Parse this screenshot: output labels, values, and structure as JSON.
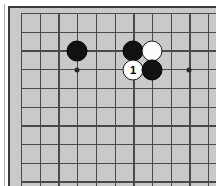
{
  "board": {
    "name": "go-board-diagram",
    "background_color": "#c9c9c9",
    "page_background": "#ffffff",
    "line_color": "#4a4a4a",
    "frame_color": "#3a3a3a",
    "grid_columns": 11,
    "grid_rows": 10,
    "grid_origin_x": 21,
    "grid_origin_y": 13,
    "grid_spacing": 18.7,
    "star_point_color": "#2c2c2c",
    "star_points": [
      {
        "name": "star-point-left",
        "x": 77,
        "y": 70
      },
      {
        "name": "star-point-right",
        "x": 189,
        "y": 70
      }
    ],
    "stones": [
      {
        "name": "black-stone-left",
        "color": "black",
        "x": 77,
        "y": 51,
        "label": ""
      },
      {
        "name": "black-stone-upper",
        "color": "black",
        "x": 133,
        "y": 51,
        "label": ""
      },
      {
        "name": "white-stone-upper-right",
        "color": "white",
        "x": 152,
        "y": 51,
        "label": ""
      },
      {
        "name": "white-stone-move-1",
        "color": "white",
        "x": 133,
        "y": 70,
        "label": "1"
      },
      {
        "name": "black-stone-lower-right",
        "color": "black",
        "x": 152,
        "y": 70,
        "label": ""
      }
    ],
    "stone_colors": {
      "black_fill": "#121212",
      "white_fill": "#fbfbfb",
      "white_outline": "#1a1a1a",
      "black_label_text": "#ffffff",
      "white_label_text": "#000000"
    },
    "move_numbers": [
      "1"
    ]
  }
}
